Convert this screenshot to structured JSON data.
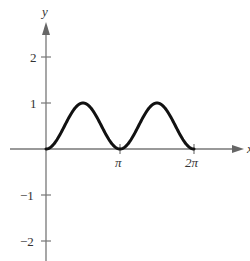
{
  "chart_data": {
    "type": "line",
    "title": "",
    "xlabel": "x",
    "ylabel": "y",
    "function": "y = sin^2(x)",
    "x_ticks": [
      {
        "value": 3.14159,
        "label": "π"
      },
      {
        "value": 6.28319,
        "label": "2π"
      }
    ],
    "y_ticks": [
      {
        "value": 2,
        "label": "2"
      },
      {
        "value": 1,
        "label": "1"
      },
      {
        "value": -1,
        "label": "−1"
      },
      {
        "value": -2,
        "label": "−2"
      }
    ],
    "xlim": [
      -1.2,
      6.6
    ],
    "ylim": [
      -2.4,
      3.2
    ],
    "domain": [
      0,
      6.28319
    ],
    "series": [
      {
        "name": "sin^2(x)",
        "x": [
          0,
          0.3927,
          0.7854,
          1.1781,
          1.5708,
          1.9635,
          2.3562,
          2.7489,
          3.1416,
          3.5343,
          3.927,
          4.3197,
          4.7124,
          5.1051,
          5.4978,
          5.8905,
          6.2832
        ],
        "y": [
          0,
          0.146,
          0.5,
          0.854,
          1,
          0.854,
          0.5,
          0.146,
          0,
          0.146,
          0.5,
          0.854,
          1,
          0.854,
          0.5,
          0.146,
          0
        ]
      }
    ],
    "grid": false,
    "legend": null,
    "colors": {
      "curve": "#111111",
      "axes": "#777777",
      "text": "#333333"
    }
  }
}
